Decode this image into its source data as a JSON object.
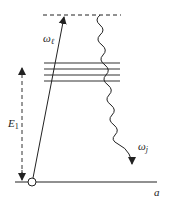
{
  "diagram": {
    "type": "energy-level-diagram",
    "labels": {
      "omega_l": "ω",
      "omega_l_sub": "ℓ",
      "energy": "E",
      "energy_sub": "1",
      "omega_j": "ω",
      "omega_j_sub": "j",
      "state": "a"
    },
    "elements": {
      "virtual_level": "dashed top level",
      "intermediate_levels_count": 4,
      "ground_level": "solid baseline a",
      "excitation_arrow": "ω_ℓ straight arrow from ground to virtual level",
      "emission_arrow": "ω_j wavy arrow from virtual level to ground",
      "energy_gap_arrow": "E_1 dashed double arrow"
    },
    "colors": {
      "stroke": "#222222",
      "background": "#ffffff"
    }
  }
}
